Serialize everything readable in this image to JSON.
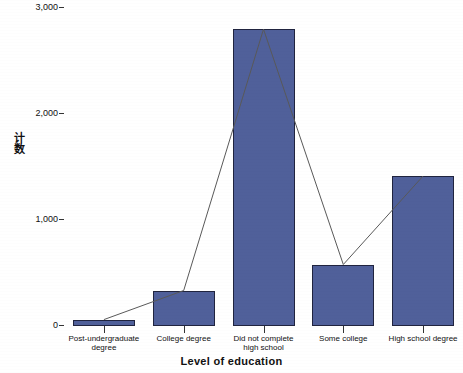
{
  "chart_data": {
    "type": "bar",
    "title": "",
    "subtitle": "",
    "xlabel": "Level of education",
    "ylabel": "计数",
    "categories": [
      "Post-undergraduate\ndegree",
      "College degree",
      "Did not complete\nhigh school",
      "Some college",
      "High school degree"
    ],
    "values": [
      60,
      335,
      2800,
      580,
      1415
    ],
    "series": [
      {
        "name": "计数",
        "type": "bar",
        "values": [
          60,
          335,
          2800,
          580,
          1415
        ]
      },
      {
        "name": "计数",
        "type": "line",
        "values": [
          60,
          335,
          2800,
          580,
          1415
        ]
      }
    ],
    "ylim": [
      0,
      3000
    ],
    "yticks": [
      0,
      1000,
      2000,
      3000
    ],
    "ytick_labels": [
      "0",
      "1,000",
      "2,000",
      "3,000"
    ],
    "grid": false,
    "legend": false,
    "bar_color": "#50609a",
    "bar_edge_color": "#20243f",
    "line_color": "#595959",
    "background": "#ffffff"
  },
  "axes": {
    "y_title_chars": [
      "计",
      "数"
    ],
    "x_title": "Level of education"
  }
}
